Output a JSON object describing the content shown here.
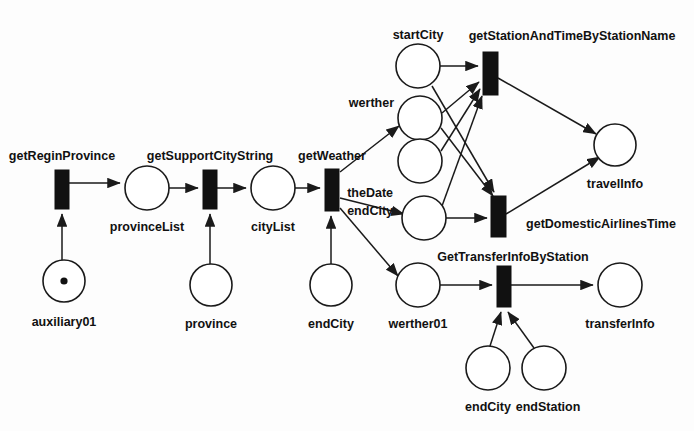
{
  "diagram": {
    "type": "petri-net",
    "title": "",
    "colors": {
      "stroke": "#1a1a1a",
      "transition_fill": "#111111",
      "place_fill": "#ffffff",
      "background": "#fdfdfd"
    },
    "places": [
      {
        "id": "auxiliary01",
        "label": "auxiliary01",
        "cx": 64,
        "cy": 281,
        "r": 21,
        "tokens": 1,
        "label_x": 64,
        "label_y": 323,
        "anchor": "middle"
      },
      {
        "id": "provinceList",
        "label": "provinceList",
        "cx": 147,
        "cy": 188,
        "r": 22,
        "tokens": 0,
        "label_x": 147,
        "label_y": 228,
        "anchor": "middle"
      },
      {
        "id": "province",
        "label": "province",
        "cx": 211,
        "cy": 285,
        "r": 21,
        "tokens": 0,
        "label_x": 211,
        "label_y": 325,
        "anchor": "middle"
      },
      {
        "id": "cityList",
        "label": "cityList",
        "cx": 273,
        "cy": 188,
        "r": 22,
        "tokens": 0,
        "label_x": 273,
        "label_y": 228,
        "anchor": "middle"
      },
      {
        "id": "endCityLeft",
        "label": "endCity",
        "cx": 331,
        "cy": 285,
        "r": 21,
        "tokens": 0,
        "label_x": 331,
        "label_y": 325,
        "anchor": "middle"
      },
      {
        "id": "startCity",
        "label": "startCity",
        "cx": 418,
        "cy": 66,
        "r": 22,
        "tokens": 0,
        "label_x": 418,
        "label_y": 36,
        "anchor": "middle"
      },
      {
        "id": "werther",
        "label": "werther",
        "cx": 420,
        "cy": 118,
        "r": 22,
        "tokens": 0,
        "label_x": 394,
        "label_y": 104,
        "anchor": "end"
      },
      {
        "id": "theDate",
        "label": "theDate",
        "cx": 420,
        "cy": 161,
        "r": 22,
        "tokens": 0,
        "label_x": 393,
        "label_y": 194,
        "anchor": "end"
      },
      {
        "id": "endCityMid",
        "label": "endCity",
        "cx": 424,
        "cy": 218,
        "r": 22,
        "tokens": 0,
        "label_x": 393,
        "label_y": 212,
        "anchor": "end"
      },
      {
        "id": "werther01",
        "label": "werther01",
        "cx": 418,
        "cy": 285,
        "r": 22,
        "tokens": 0,
        "label_x": 418,
        "label_y": 325,
        "anchor": "middle"
      },
      {
        "id": "travelInfo",
        "label": "travelInfo",
        "cx": 615,
        "cy": 145,
        "r": 21,
        "tokens": 0,
        "label_x": 615,
        "label_y": 185,
        "anchor": "middle"
      },
      {
        "id": "transferInfo",
        "label": "transferInfo",
        "cx": 620,
        "cy": 285,
        "r": 22,
        "tokens": 0,
        "label_x": 620,
        "label_y": 325,
        "anchor": "middle"
      },
      {
        "id": "endCityBottom",
        "label": "endCity",
        "cx": 488,
        "cy": 368,
        "r": 22,
        "tokens": 0,
        "label_x": 488,
        "label_y": 408,
        "anchor": "middle"
      },
      {
        "id": "endStation",
        "label": "endStation",
        "cx": 544,
        "cy": 368,
        "r": 22,
        "tokens": 0,
        "label_x": 548,
        "label_y": 408,
        "anchor": "middle"
      }
    ],
    "transitions": [
      {
        "id": "getReginProvince",
        "label": "getReginProvince",
        "x": 55,
        "y": 170,
        "w": 14,
        "h": 39,
        "label_x": 62,
        "label_y": 157,
        "anchor": "middle"
      },
      {
        "id": "getSupportCityString",
        "label": "getSupportCityString",
        "x": 203,
        "y": 170,
        "w": 14,
        "h": 39,
        "label_x": 210,
        "label_y": 157,
        "anchor": "middle"
      },
      {
        "id": "getWeather",
        "label": "getWeather",
        "x": 325,
        "y": 169,
        "w": 14,
        "h": 42,
        "label_x": 332,
        "label_y": 157,
        "anchor": "middle"
      },
      {
        "id": "getStationAndTimeByStationName",
        "label": "getStationAndTimeByStationName",
        "x": 483,
        "y": 52,
        "w": 15,
        "h": 43,
        "label_x": 572,
        "label_y": 37,
        "anchor": "middle"
      },
      {
        "id": "getDomesticAirlinesTime",
        "label": "getDomesticAirlinesTime",
        "x": 491,
        "y": 196,
        "w": 15,
        "h": 41,
        "label_x": 601,
        "label_y": 225,
        "anchor": "middle"
      },
      {
        "id": "GetTransferInfoByStation",
        "label": "GetTransferInfoByStation",
        "x": 497,
        "y": 266,
        "w": 14,
        "h": 41,
        "label_x": 513,
        "label_y": 258,
        "anchor": "middle"
      }
    ],
    "arcs": [
      {
        "id": "arc-auxiliary01-to-getReginProvince",
        "from": "auxiliary01",
        "to": "getReginProvince",
        "d": "M 62,260 L 62,214"
      },
      {
        "id": "arc-getReginProvince-to-provinceList",
        "from": "getReginProvince",
        "to": "provinceList",
        "d": "M 69,183 L 120,183"
      },
      {
        "id": "arc-provinceList-to-getSupportCityString",
        "from": "provinceList",
        "to": "getSupportCityString",
        "d": "M 169,188 L 198,188"
      },
      {
        "id": "arc-province-to-getSupportCityString",
        "from": "province",
        "to": "getSupportCityString",
        "d": "M 210,264 L 210,214"
      },
      {
        "id": "arc-getSupportCityString-to-cityList",
        "from": "getSupportCityString",
        "to": "cityList",
        "d": "M 217,188 L 246,188"
      },
      {
        "id": "arc-cityList-to-getWeather",
        "from": "cityList",
        "to": "getWeather",
        "d": "M 295,188 L 320,188"
      },
      {
        "id": "arc-endCityLeft-to-getWeather",
        "from": "endCityLeft",
        "to": "getWeather",
        "d": "M 331,264 L 331,216"
      },
      {
        "id": "arc-getWeather-to-werther",
        "from": "getWeather",
        "to": "werther",
        "d": "M 340,172 L 399,126"
      },
      {
        "id": "arc-getWeather-to-endCityMid",
        "from": "getWeather",
        "to": "endCityMid",
        "d": "M 340,198 L 404,214"
      },
      {
        "id": "arc-getWeather-to-werther01",
        "from": "getWeather",
        "to": "werther01",
        "d": "M 340,208 L 398,276"
      },
      {
        "id": "arc-startCity-to-getStationAndTimeByStationName",
        "from": "startCity",
        "to": "getStationAndTimeByStationName",
        "d": "M 440,66 L 478,66"
      },
      {
        "id": "arc-startCity-to-getDomesticAirlinesTime",
        "from": "startCity",
        "to": "getDomesticAirlinesTime",
        "d": "M 432,86 L 494,192"
      },
      {
        "id": "arc-werther-to-getStationAndTimeByStationName",
        "from": "werther",
        "to": "getStationAndTimeByStationName",
        "d": "M 442,113 L 479,82"
      },
      {
        "id": "arc-werther-to-getDomesticAirlinesTime",
        "from": "werther",
        "to": "getDomesticAirlinesTime",
        "d": "M 441,128 L 493,196"
      },
      {
        "id": "arc-theDate-to-getStationAndTimeByStationName",
        "from": "theDate",
        "to": "getStationAndTimeByStationName",
        "d": "M 441,151 L 480,89"
      },
      {
        "id": "arc-endCityMid-to-getStationAndTimeByStationName",
        "from": "endCityMid",
        "to": "getStationAndTimeByStationName",
        "d": "M 442,206 L 482,96"
      },
      {
        "id": "arc-endCityMid-to-getDomesticAirlinesTime",
        "from": "endCityMid",
        "to": "getDomesticAirlinesTime",
        "d": "M 446,218 L 487,218"
      },
      {
        "id": "arc-getStationAndTimeByStationName-to-travelInfo",
        "from": "getStationAndTimeByStationName",
        "to": "travelInfo",
        "d": "M 498,78 L 596,134"
      },
      {
        "id": "arc-getDomesticAirlinesTime-to-travelInfo",
        "from": "getDomesticAirlinesTime",
        "to": "travelInfo",
        "d": "M 506,214 L 600,157"
      },
      {
        "id": "arc-werther01-to-GetTransferInfoByStation",
        "from": "werther01",
        "to": "GetTransferInfoByStation",
        "d": "M 440,285 L 492,285"
      },
      {
        "id": "arc-endCityBottom-to-GetTransferInfoByStation",
        "from": "endCityBottom",
        "to": "GetTransferInfoByStation",
        "d": "M 490,346 L 501,312"
      },
      {
        "id": "arc-endStation-to-GetTransferInfoByStation",
        "from": "endStation",
        "to": "GetTransferInfoByStation",
        "d": "M 534,348 L 508,312"
      },
      {
        "id": "arc-GetTransferInfoByStation-to-transferInfo",
        "from": "GetTransferInfoByStation",
        "to": "transferInfo",
        "d": "M 511,285 L 593,285"
      }
    ]
  }
}
